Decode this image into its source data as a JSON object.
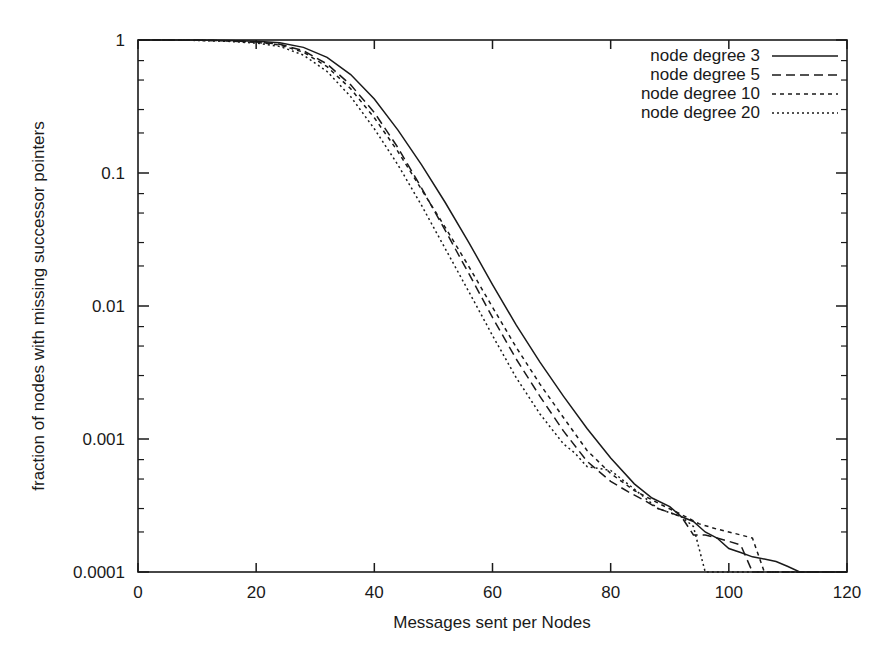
{
  "chart_data": {
    "type": "line",
    "title": "",
    "xlabel": "Messages sent per Nodes",
    "ylabel": "fraction of nodes with missing successor pointers",
    "xlim": [
      0,
      120
    ],
    "ylim": [
      0.0001,
      1
    ],
    "yscale": "log",
    "grid": false,
    "legend_position": "top-right",
    "xticks": [
      0,
      20,
      40,
      60,
      80,
      100,
      120
    ],
    "xtick_labels": [
      "0",
      "20",
      "40",
      "60",
      "80",
      "100",
      "120"
    ],
    "yticks": [
      1,
      0.1,
      0.01,
      0.001,
      0.0001
    ],
    "ytick_labels": [
      "1",
      "0.1",
      "0.01",
      "0.001",
      "0.0001"
    ],
    "series": [
      {
        "name": "node degree 3",
        "style": "solid",
        "dasharray": "none",
        "color": "#1a1a1a",
        "x": [
          0,
          5,
          10,
          15,
          20,
          24,
          28,
          32,
          36,
          40,
          44,
          48,
          52,
          56,
          60,
          64,
          68,
          72,
          76,
          80,
          84,
          87,
          90,
          92,
          94,
          96,
          98,
          100,
          102,
          104,
          106,
          108,
          110,
          112,
          120
        ],
        "y": [
          1.0,
          1.0,
          0.998,
          0.993,
          0.98,
          0.955,
          0.88,
          0.74,
          0.55,
          0.36,
          0.21,
          0.115,
          0.06,
          0.03,
          0.0145,
          0.0072,
          0.0038,
          0.0021,
          0.0012,
          0.00072,
          0.00046,
          0.00036,
          0.00031,
          0.00026,
          0.00024,
          0.0002,
          0.00018,
          0.00015,
          0.00014,
          0.00013,
          0.000125,
          0.00012,
          0.00011,
          0.0001,
          0.0001
        ]
      },
      {
        "name": "node degree 5",
        "style": "dashed",
        "dasharray": "9,5",
        "color": "#1a1a1a",
        "x": [
          0,
          5,
          10,
          15,
          20,
          24,
          28,
          32,
          36,
          40,
          44,
          48,
          52,
          56,
          60,
          64,
          68,
          72,
          76,
          80,
          83,
          86,
          88,
          90,
          92,
          94,
          96,
          98,
          100,
          102,
          104,
          120
        ],
        "y": [
          1.0,
          0.999,
          0.996,
          0.988,
          0.968,
          0.93,
          0.83,
          0.66,
          0.46,
          0.285,
          0.155,
          0.077,
          0.037,
          0.0175,
          0.0082,
          0.004,
          0.0021,
          0.00115,
          0.00068,
          0.00048,
          0.0004,
          0.00034,
          0.0003,
          0.00028,
          0.00026,
          0.00019,
          0.00019,
          0.00018,
          0.00017,
          0.00016,
          0.0001,
          0.0001
        ]
      },
      {
        "name": "node degree 10",
        "style": "dotted-dash",
        "dasharray": "4,4",
        "color": "#1a1a1a",
        "x": [
          0,
          5,
          10,
          15,
          20,
          24,
          28,
          32,
          36,
          40,
          44,
          48,
          52,
          56,
          60,
          64,
          68,
          72,
          76,
          80,
          84,
          88,
          92,
          95,
          98,
          100,
          102,
          104,
          106,
          120
        ],
        "y": [
          1.0,
          0.999,
          0.995,
          0.985,
          0.962,
          0.918,
          0.81,
          0.63,
          0.43,
          0.26,
          0.145,
          0.075,
          0.039,
          0.0198,
          0.0098,
          0.0049,
          0.0026,
          0.00145,
          0.00082,
          0.00055,
          0.00041,
          0.00033,
          0.00027,
          0.00023,
          0.00021,
          0.0002,
          0.00019,
          0.00018,
          0.0001,
          0.0001
        ]
      },
      {
        "name": "node degree 20",
        "style": "dotted",
        "dasharray": "2,3",
        "color": "#1a1a1a",
        "x": [
          0,
          5,
          10,
          15,
          20,
          24,
          28,
          32,
          36,
          40,
          44,
          48,
          52,
          56,
          60,
          64,
          68,
          72,
          74,
          76,
          78,
          80,
          84,
          88,
          92,
          94,
          96,
          98,
          100,
          120
        ],
        "y": [
          1.0,
          0.998,
          0.993,
          0.978,
          0.948,
          0.895,
          0.77,
          0.58,
          0.375,
          0.215,
          0.115,
          0.057,
          0.027,
          0.0128,
          0.006,
          0.0029,
          0.00155,
          0.00092,
          0.00078,
          0.00062,
          0.0006,
          0.00058,
          0.00042,
          0.0003,
          0.00026,
          0.00022,
          0.0001,
          0.0001,
          0.0001,
          0.0001
        ]
      }
    ]
  },
  "legend": {
    "entries": [
      {
        "label": "node degree 3"
      },
      {
        "label": "node degree 5"
      },
      {
        "label": "node degree 10"
      },
      {
        "label": "node degree 20"
      }
    ]
  }
}
